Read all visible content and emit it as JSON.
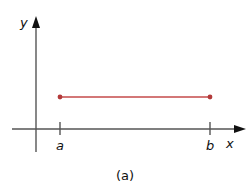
{
  "figure": {
    "caption": "(a)",
    "x_axis_label": "x",
    "y_axis_label": "y",
    "ticks": [
      {
        "label": "a"
      },
      {
        "label": "b"
      }
    ],
    "segment": {
      "description": "horizontal line segment from a to b at constant y",
      "color": "#c44a4a",
      "endpoints": [
        "a",
        "b"
      ]
    }
  }
}
